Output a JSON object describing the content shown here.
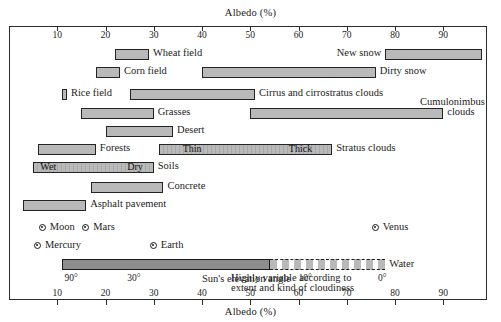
{
  "chart_data": {
    "type": "bar",
    "title": "Albedo (%)",
    "xlabel_top": "Albedo (%)",
    "xlabel_bottom": "Albedo (%)",
    "xlim": [
      0,
      100
    ],
    "ticks": [
      10,
      20,
      30,
      40,
      50,
      60,
      70,
      80,
      90
    ],
    "tick_labels": [
      "10",
      "20",
      "30",
      "40",
      "50",
      "60",
      "70",
      "80",
      "90"
    ],
    "grid": false,
    "legend": "none",
    "orientation": "horizontal-range-bars",
    "bars": [
      {
        "label": "Wheat field",
        "min": 22,
        "max": 29,
        "label_side": "right"
      },
      {
        "label": "New snow",
        "min": 78,
        "max": 98,
        "label_side": "left"
      },
      {
        "label": "Corn field",
        "min": 18,
        "max": 23,
        "label_side": "right"
      },
      {
        "label": "Dirty snow",
        "min": 40,
        "max": 76,
        "label_side": "right"
      },
      {
        "label": "Rice field",
        "min": 11,
        "max": 12,
        "label_side": "right"
      },
      {
        "label": "Cirrus and cirrostratus clouds",
        "min": 25,
        "max": 51,
        "label_side": "right"
      },
      {
        "label": "Grasses",
        "min": 15,
        "max": 30,
        "label_side": "right"
      },
      {
        "label": "Cumulonimbus clouds",
        "min": 50,
        "max": 90,
        "label_side": "right"
      },
      {
        "label": "Desert",
        "min": 20,
        "max": 34,
        "label_side": "right"
      },
      {
        "label": "Forests",
        "min": 6,
        "max": 18,
        "label_side": "right"
      },
      {
        "label": "Stratus clouds",
        "min": 31,
        "max": 67,
        "label_side": "right"
      },
      {
        "label": "Soils",
        "min": 5,
        "max": 30,
        "label_side": "right"
      },
      {
        "label": "Concrete",
        "min": 17,
        "max": 32,
        "label_side": "right"
      },
      {
        "label": "Asphalt pavement",
        "min": 3,
        "max": 16,
        "label_side": "right"
      },
      {
        "label": "Water",
        "min": 11,
        "max": 78,
        "label_side": "right"
      }
    ],
    "inbar_labels": [
      {
        "text": "Thin",
        "bar": "Stratus clouds"
      },
      {
        "text": "Thick",
        "bar": "Stratus clouds"
      },
      {
        "text": "Wet",
        "bar": "Soils"
      },
      {
        "text": "Dry",
        "bar": "Soils"
      }
    ],
    "planets": [
      {
        "name": "Moon",
        "albedo": 7
      },
      {
        "name": "Mars",
        "albedo": 16
      },
      {
        "name": "Venus",
        "albedo": 76
      },
      {
        "name": "Mercury",
        "albedo": 6
      },
      {
        "name": "Earth",
        "albedo": 30
      }
    ],
    "sun_elevation": {
      "axis_label": "Sun's elevation angle",
      "angles": [
        "90°",
        "30°",
        "10°",
        "0°"
      ],
      "note_line1": "Highly variable according to",
      "note_line2": "extent and kind of cloudiness"
    }
  },
  "labels": {
    "wheat_field": "Wheat field",
    "new_snow": "New snow",
    "corn_field": "Corn field",
    "dirty_snow": "Dirty snow",
    "rice_field": "Rice field",
    "cirrus": "Cirrus and cirrostratus clouds",
    "grasses": "Grasses",
    "cumulonimbus_l1": "Cumulonimbus",
    "cumulonimbus_l2": "clouds",
    "desert": "Desert",
    "forests": "Forests",
    "thin": "Thin",
    "thick": "Thick",
    "stratus": "Stratus clouds",
    "wet": "Wet",
    "dry": "Dry",
    "soils": "Soils",
    "concrete": "Concrete",
    "asphalt": "Asphalt pavement",
    "moon": "Moon",
    "mars": "Mars",
    "venus": "Venus",
    "mercury": "Mercury",
    "earth": "Earth",
    "water": "Water",
    "sun_axis": "Sun's elevation angle",
    "a90": "90°",
    "a30": "30°",
    "a10": "10°",
    "a0": "0°",
    "note1": "Highly variable according to",
    "note2": "extent and kind of cloudiness",
    "albedo_top": "Albedo (%)",
    "albedo_bottom": "Albedo (%)"
  },
  "colors": {
    "bar_fill": "#b9b9b9",
    "bar_stroke": "#242424",
    "frame": "#2b2b2b",
    "text": "#1b1b1b",
    "water_fill": "#8d8d8d"
  }
}
